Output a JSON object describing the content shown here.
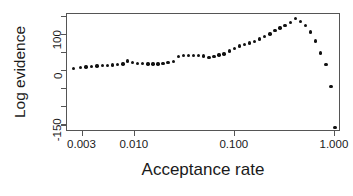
{
  "chart_data": {
    "type": "scatter",
    "title": "",
    "xlabel": "Acceptance rate",
    "ylabel": "Log evidence",
    "xscale": "log",
    "yscale": "linear",
    "xlim": [
      0.0021,
      1.15
    ],
    "ylim": [
      -168,
      158
    ],
    "grid": false,
    "legend": null,
    "x_tick_labels": [
      "0.003",
      "0.010",
      "0.100",
      "1.000"
    ],
    "x_tick_values": [
      0.003,
      0.01,
      0.1,
      1.0
    ],
    "y_tick_labels": [
      "-150",
      "",
      "",
      "0",
      "",
      "100",
      ""
    ],
    "y_tick_values": [
      -150,
      -100,
      -50,
      0,
      50,
      100,
      150
    ],
    "y_labeled_ticks": [
      -150,
      0,
      100
    ],
    "marker": "filled-circle",
    "marker_color": "#111111",
    "x": [
      0.00245,
      0.00285,
      0.00325,
      0.0037,
      0.0042,
      0.00475,
      0.00535,
      0.006,
      0.00675,
      0.0076,
      0.0085,
      0.0095,
      0.0107,
      0.012,
      0.0135,
      0.0152,
      0.017,
      0.0192,
      0.0215,
      0.0242,
      0.0272,
      0.0306,
      0.0344,
      0.0387,
      0.0435,
      0.0489,
      0.055,
      0.0618,
      0.0695,
      0.0781,
      0.0878,
      0.0987,
      0.111,
      0.125,
      0.14,
      0.158,
      0.177,
      0.199,
      0.224,
      0.252,
      0.283,
      0.318,
      0.358,
      0.402,
      0.452,
      0.508,
      0.571,
      0.642,
      0.722,
      0.812,
      0.913,
      1.0
    ],
    "y": [
      8,
      10,
      12,
      13,
      14,
      15,
      16,
      17,
      19,
      20,
      28,
      24,
      22,
      21,
      20,
      20,
      20,
      21,
      24,
      26,
      41,
      43,
      43,
      44,
      44,
      42,
      38,
      40,
      45,
      48,
      56,
      62,
      70,
      73,
      78,
      82,
      89,
      96,
      103,
      112,
      119,
      127,
      134,
      145,
      138,
      126,
      108,
      83,
      50,
      18,
      -42,
      -155
    ],
    "n_points": 52,
    "peak": {
      "x": 0.402,
      "y": 145
    },
    "min": {
      "x": 1.0,
      "y": -155
    }
  },
  "axes": {
    "y_title": "Log evidence",
    "x_title": "Acceptance rate",
    "x_ticks": [
      {
        "label": "0.003",
        "value": 0.003
      },
      {
        "label": "0.010",
        "value": 0.01
      },
      {
        "label": "0.100",
        "value": 0.1
      },
      {
        "label": "1.000",
        "value": 1.0
      }
    ],
    "y_ticks": [
      {
        "label": "",
        "value": 150
      },
      {
        "label": "100",
        "value": 100
      },
      {
        "label": "",
        "value": 50
      },
      {
        "label": "0",
        "value": 0
      },
      {
        "label": "",
        "value": -50
      },
      {
        "label": "",
        "value": -100
      },
      {
        "label": "-150",
        "value": -150
      }
    ]
  },
  "style": {
    "frame_color": "#555555",
    "point_color": "#111111",
    "text_color": "#1a1a1a",
    "background": "#ffffff"
  }
}
